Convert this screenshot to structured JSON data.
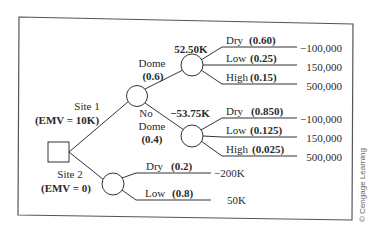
{
  "diagram": {
    "type": "decision-tree",
    "colors": {
      "line": "#333333",
      "text": "#2a2a2a",
      "frame": "#555555",
      "background": "#ffffff"
    },
    "decision_node": {
      "shape": "square"
    },
    "branches": {
      "site1": {
        "label": "Site 1",
        "emv": "(EMV = 10K)",
        "chance": {
          "dome": {
            "label": "Dome",
            "prob": "(0.6)",
            "value": "52.50K",
            "outcomes": [
              {
                "label": "Dry",
                "prob": "(0.60)",
                "payoff": "−100,000"
              },
              {
                "label": "Low",
                "prob": "(0.25)",
                "payoff": "150,000"
              },
              {
                "label": "High",
                "prob": "(0.15)",
                "payoff": "500,000"
              }
            ]
          },
          "nodome": {
            "label_line1": "No",
            "label_line2": "Dome",
            "prob": "(0.4)",
            "value": "−53.75K",
            "outcomes": [
              {
                "label": "Dry",
                "prob": "(0.850)",
                "payoff": "−100,000"
              },
              {
                "label": "Low",
                "prob": "(0.125)",
                "payoff": "150,000"
              },
              {
                "label": "High",
                "prob": "(0.025)",
                "payoff": "500,000"
              }
            ]
          }
        }
      },
      "site2": {
        "label": "Site 2",
        "emv": "(EMV = 0)",
        "outcomes": [
          {
            "label": "Dry",
            "prob": "(0.2)",
            "payoff": "−200K"
          },
          {
            "label": "Low",
            "prob": "(0.8)",
            "payoff": "50K"
          }
        ]
      }
    },
    "credit": "© Cengage Learning"
  }
}
